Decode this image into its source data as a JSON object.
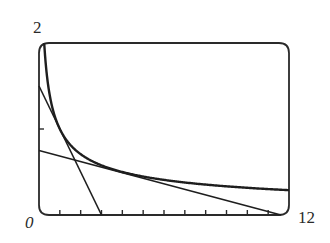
{
  "chart_data": {
    "type": "line",
    "title": "",
    "xlabel": "",
    "ylabel": "",
    "xlim": [
      0,
      12
    ],
    "ylim": [
      0,
      2
    ],
    "x_tick_step": 1,
    "y_tick_step": 1,
    "grid": false,
    "legend": null,
    "tick_labels": {
      "y_max": "2",
      "origin": "0",
      "x_max": "12"
    },
    "series": [
      {
        "name": "curve",
        "expression": "y = 1/sqrt(x)",
        "x": [
          0.25,
          0.5,
          1,
          2,
          3,
          4,
          6,
          8,
          10,
          12
        ],
        "y": [
          2.0,
          1.414,
          1.0,
          0.707,
          0.577,
          0.5,
          0.408,
          0.354,
          0.316,
          0.289
        ]
      },
      {
        "name": "tangent-at-x1",
        "expression": "y = 1.5 - 0.5x",
        "x": [
          0,
          3
        ],
        "y": [
          1.5,
          0
        ]
      },
      {
        "name": "tangent-at-x4",
        "expression": "y = 0.75 - 0.0625x",
        "x": [
          0,
          12
        ],
        "y": [
          0.75,
          0
        ]
      }
    ]
  },
  "colors": {
    "line": "#1e1e1e",
    "frame": "#2a2a2a",
    "background": "#ffffff"
  }
}
